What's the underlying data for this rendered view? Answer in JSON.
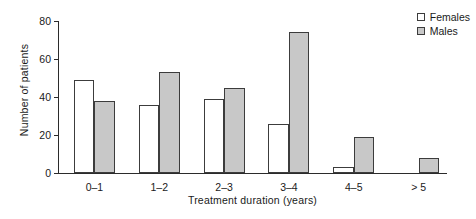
{
  "chart_data": {
    "type": "bar",
    "title": "",
    "xlabel": "Treatment duration (years)",
    "ylabel": "Number of patients",
    "categories": [
      "0–1",
      "1–2",
      "2–3",
      "3–4",
      "4–5",
      "> 5"
    ],
    "series": [
      {
        "name": "Females",
        "color": "#ffffff",
        "values": [
          49,
          36,
          39,
          26,
          3,
          0
        ]
      },
      {
        "name": "Males",
        "color": "#c8c8c8",
        "values": [
          38,
          53,
          45,
          74,
          19,
          8
        ]
      }
    ],
    "ylim": [
      0,
      80
    ],
    "yticks": [
      0,
      20,
      40,
      60,
      80
    ],
    "ytick_labels": [
      "0",
      "20",
      "40",
      "60",
      "80"
    ],
    "grid": false,
    "legend_position": "top-right",
    "bar_outline_color": "#3c3c3c",
    "axis_color": "#2b2b2b"
  },
  "legend": {
    "entries": [
      {
        "label": "Females"
      },
      {
        "label": "Males"
      }
    ]
  }
}
